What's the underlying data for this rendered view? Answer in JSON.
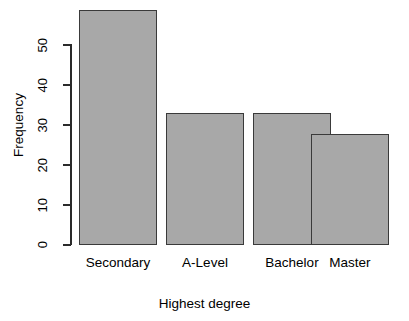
{
  "chart_data": {
    "type": "bar",
    "title": "",
    "xlabel": "Highest degree",
    "ylabel": "Frequency",
    "categories": [
      "Secondary",
      "A-Level",
      "Bachelor",
      "Master"
    ],
    "values": [
      57,
      32,
      32,
      27
    ],
    "ylim": [
      0,
      57
    ],
    "yticks": [
      0,
      10,
      20,
      30,
      40,
      50
    ],
    "ytick_labels": [
      "0",
      "10",
      "20",
      "30",
      "40",
      "50"
    ],
    "grid": false,
    "legend": false,
    "legend_position": "none",
    "bar_fill_color": "#a8a8a8",
    "bar_border_color": "#3a3a3a",
    "axis_color": "#2b2b2b",
    "background_color": "#ffffff"
  }
}
